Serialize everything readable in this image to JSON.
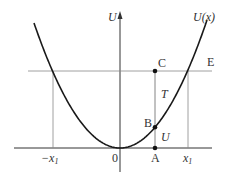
{
  "diagram": {
    "axis_labels": {
      "y_axis": "U",
      "origin": "0"
    },
    "curve_label": "U(x)",
    "energy_line_label": "E",
    "x_tick_labels": {
      "left": "−x",
      "left_sub": "1",
      "right": "x",
      "right_sub": "1"
    },
    "points": [
      {
        "name": "A",
        "label": "A"
      },
      {
        "name": "B",
        "label": "B"
      },
      {
        "name": "C",
        "label": "C"
      }
    ],
    "segment_labels": {
      "kinetic": "T",
      "potential": "U"
    },
    "colors": {
      "curve": "#1a1a1a",
      "lines": "#888888",
      "axis": "#333333"
    }
  }
}
